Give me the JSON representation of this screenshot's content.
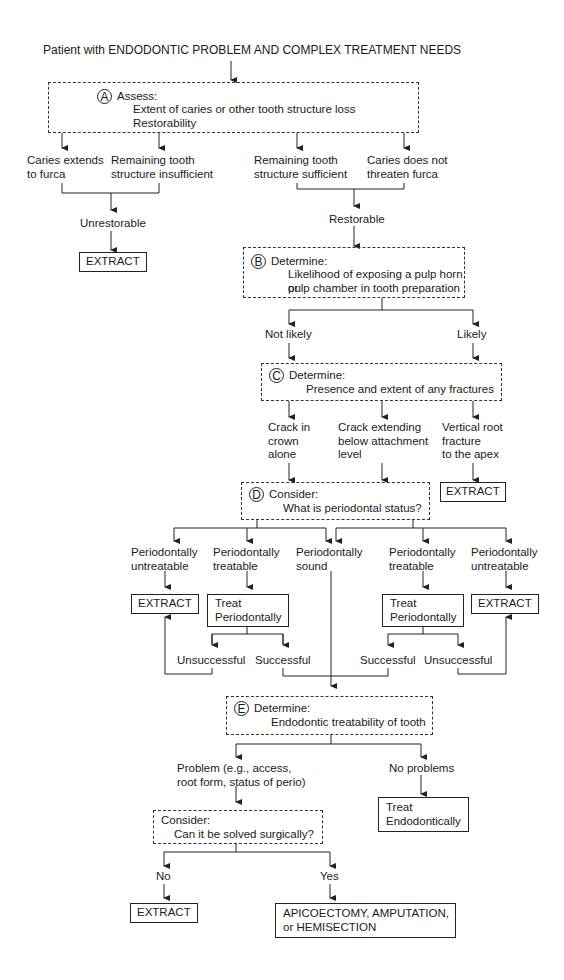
{
  "title": "Patient with ENDODONTIC PROBLEM AND COMPLEX TREATMENT NEEDS",
  "A": {
    "letter": "A",
    "heading": "Assess:",
    "lines": [
      "Extent of caries or other tooth structure loss",
      "Restorability"
    ]
  },
  "a_outcomes": {
    "caries_furca": "Caries extends\nto furca",
    "remaining_insufficient": "Remaining tooth\nstructure insufficient",
    "remaining_sufficient": "Remaining tooth\nstructure sufficient",
    "caries_not_threaten": "Caries does not\nthreaten furca",
    "unrestorable": "Unrestorable",
    "restorable": "Restorable",
    "extract": "EXTRACT"
  },
  "B": {
    "letter": "B",
    "heading": "Determine:",
    "lines": [
      "Likelihood of exposing a pulp horn or",
      "pulp chamber in tooth preparation"
    ]
  },
  "b_outcomes": {
    "not_likely": "Not likely",
    "likely": "Likely"
  },
  "C": {
    "letter": "C",
    "heading": "Determine:",
    "lines": [
      "Presence and extent of any fractures"
    ]
  },
  "c_outcomes": {
    "crack_crown": "Crack in\ncrown\nalone",
    "crack_below": "Crack extending\nbelow attachment\nlevel",
    "vertical_root": "Vertical root\nfracture\nto the apex",
    "extract": "EXTRACT"
  },
  "D": {
    "letter": "D",
    "heading": "Consider:",
    "lines": [
      "What is periodontal status?"
    ]
  },
  "d_outcomes": {
    "untreatable_left": "Periodontally\nuntreatable",
    "treatable_left": "Periodontally\ntreatable",
    "sound": "Periodontally\nsound",
    "treatable_right": "Periodontally\ntreatable",
    "untreatable_right": "Periodontally\nuntreatable",
    "extract_left": "EXTRACT",
    "treat_perio_left": "Treat\nPeriodontally",
    "treat_perio_right": "Treat\nPeriodontally",
    "extract_right": "EXTRACT",
    "unsuccessful_left": "Unsuccessful",
    "successful_left": "Successful",
    "successful_right": "Successful",
    "unsuccessful_right": "Unsuccessful"
  },
  "E": {
    "letter": "E",
    "heading": "Determine:",
    "lines": [
      "Endodontic treatability of tooth"
    ]
  },
  "e_outcomes": {
    "problem": "Problem (e.g., access,\nroot form, status of perio)",
    "no_problems": "No problems",
    "treat_endo": "Treat\nEndodontically"
  },
  "F": {
    "heading": "Consider:",
    "lines": [
      "Can it be solved surgically?"
    ]
  },
  "f_outcomes": {
    "no": "No",
    "yes": "Yes",
    "extract": "EXTRACT",
    "surgery": "APICOECTOMY, AMPUTATION,\nor HEMISECTION"
  }
}
